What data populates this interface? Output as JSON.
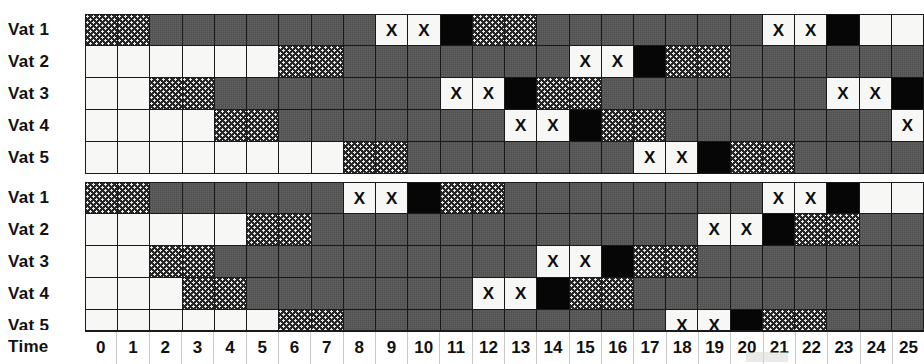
{
  "figure": {
    "kind": "vat-schedule-gantt",
    "time_axis_label": "Time",
    "time_ticks": [
      "0",
      "1",
      "2",
      "3",
      "4",
      "5",
      "6",
      "7",
      "8",
      "9",
      "10",
      "11",
      "12",
      "13",
      "14",
      "15",
      "16",
      "17",
      "18",
      "19",
      "20",
      "21",
      "22",
      "23",
      "24",
      "25"
    ],
    "x_mark": "X",
    "legend_meaning": {
      "empty": "idle / empty",
      "fill": "filling (dotted dark)",
      "process": "processing (solid gray)",
      "x": "discharge / sample (marked X)",
      "black": "cleaning (solid black)"
    },
    "colors": {
      "empty": "#f7f7f5",
      "fill": "#262626",
      "process": "#585858",
      "black": "#060606",
      "grid": "#1a1a1a",
      "text": "#101010"
    }
  },
  "chart_data": {
    "type": "heatmap",
    "title": "",
    "xlabel": "Time",
    "ylabel": "",
    "x": [
      "0",
      "1",
      "2",
      "3",
      "4",
      "5",
      "6",
      "7",
      "8",
      "9",
      "10",
      "11",
      "12",
      "13",
      "14",
      "15",
      "16",
      "17",
      "18",
      "19",
      "20",
      "21",
      "22",
      "23",
      "24",
      "25"
    ],
    "grid": true,
    "legend": [
      "empty",
      "fill",
      "process",
      "x",
      "black"
    ],
    "blocks": [
      {
        "name": "schedule-block-1",
        "rows": [
          {
            "label": "Vat 1",
            "cells": [
              "fill",
              "fill",
              "process",
              "process",
              "process",
              "process",
              "process",
              "process",
              "process",
              "x",
              "x",
              "black",
              "fill",
              "fill",
              "process",
              "process",
              "process",
              "process",
              "process",
              "process",
              "process",
              "x",
              "x",
              "black",
              "empty",
              "empty"
            ]
          },
          {
            "label": "Vat 2",
            "cells": [
              "empty",
              "empty",
              "empty",
              "empty",
              "empty",
              "empty",
              "fill",
              "fill",
              "process",
              "process",
              "process",
              "process",
              "process",
              "process",
              "process",
              "x",
              "x",
              "black",
              "fill",
              "fill",
              "process",
              "process",
              "process",
              "process",
              "process",
              "process"
            ]
          },
          {
            "label": "Vat 3",
            "cells": [
              "empty",
              "empty",
              "fill",
              "fill",
              "process",
              "process",
              "process",
              "process",
              "process",
              "process",
              "process",
              "x",
              "x",
              "black",
              "fill",
              "fill",
              "process",
              "process",
              "process",
              "process",
              "process",
              "process",
              "process",
              "x",
              "x",
              "black"
            ]
          },
          {
            "label": "Vat 4",
            "cells": [
              "empty",
              "empty",
              "empty",
              "empty",
              "fill",
              "fill",
              "process",
              "process",
              "process",
              "process",
              "process",
              "process",
              "process",
              "x",
              "x",
              "black",
              "fill",
              "fill",
              "process",
              "process",
              "process",
              "process",
              "process",
              "process",
              "process",
              "x"
            ]
          },
          {
            "label": "Vat 5",
            "cells": [
              "empty",
              "empty",
              "empty",
              "empty",
              "empty",
              "empty",
              "empty",
              "empty",
              "fill",
              "fill",
              "process",
              "process",
              "process",
              "process",
              "process",
              "process",
              "process",
              "x",
              "x",
              "black",
              "fill",
              "fill",
              "process",
              "process",
              "process",
              "process"
            ]
          }
        ]
      },
      {
        "name": "schedule-block-2",
        "rows": [
          {
            "label": "Vat 1",
            "cells": [
              "fill",
              "fill",
              "process",
              "process",
              "process",
              "process",
              "process",
              "process",
              "x",
              "x",
              "black",
              "fill",
              "fill",
              "process",
              "process",
              "process",
              "process",
              "process",
              "process",
              "process",
              "process",
              "x",
              "x",
              "black",
              "empty",
              "empty"
            ]
          },
          {
            "label": "Vat 2",
            "cells": [
              "empty",
              "empty",
              "empty",
              "empty",
              "empty",
              "fill",
              "fill",
              "process",
              "process",
              "process",
              "process",
              "process",
              "process",
              "process",
              "process",
              "process",
              "process",
              "process",
              "process",
              "x",
              "x",
              "black",
              "fill",
              "fill",
              "process",
              "process"
            ]
          },
          {
            "label": "Vat 3",
            "cells": [
              "empty",
              "empty",
              "fill",
              "fill",
              "process",
              "process",
              "process",
              "process",
              "process",
              "process",
              "process",
              "process",
              "process",
              "process",
              "x",
              "x",
              "black",
              "fill",
              "fill",
              "process",
              "process",
              "process",
              "process",
              "process",
              "process",
              "process"
            ]
          },
          {
            "label": "Vat 4",
            "cells": [
              "empty",
              "empty",
              "empty",
              "fill",
              "fill",
              "process",
              "process",
              "process",
              "process",
              "process",
              "process",
              "process",
              "x",
              "x",
              "black",
              "fill",
              "fill",
              "process",
              "process",
              "process",
              "process",
              "process",
              "process",
              "process",
              "process",
              "process"
            ]
          },
          {
            "label": "Vat 5",
            "cells": [
              "empty",
              "empty",
              "empty",
              "empty",
              "empty",
              "empty",
              "fill",
              "fill",
              "process",
              "process",
              "process",
              "process",
              "process",
              "process",
              "process",
              "process",
              "process",
              "process",
              "x",
              "x",
              "black",
              "fill",
              "fill",
              "process",
              "process",
              "process"
            ]
          }
        ]
      }
    ]
  }
}
